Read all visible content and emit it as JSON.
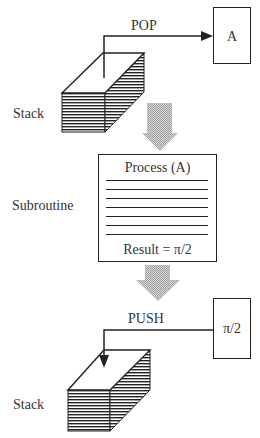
{
  "diagram": {
    "type": "stack-subroutine-flow",
    "top": {
      "stack_label": "Stack",
      "operation_label": "POP",
      "register_value": "A"
    },
    "subroutine": {
      "side_label": "Subroutine",
      "title": "Process (A)",
      "code_lines": 7,
      "result": "Result = π/2"
    },
    "bottom": {
      "stack_label": "Stack",
      "operation_label": "PUSH",
      "register_value": "π/2"
    },
    "colors": {
      "line": "#222222",
      "flow_arrow": "#b8b8b8",
      "background": "#ffffff"
    }
  }
}
